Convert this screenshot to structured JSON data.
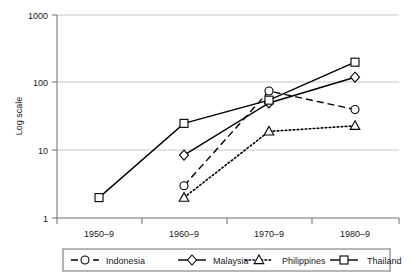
{
  "chart_data": {
    "type": "line",
    "title": "",
    "xlabel": "",
    "ylabel": "Log scale",
    "scale": "log",
    "ylim": [
      1,
      1000
    ],
    "ytick_labels": [
      "1000",
      "100",
      "10",
      "1"
    ],
    "ytick_values": [
      1000,
      100,
      10,
      1
    ],
    "grid": true,
    "legend_position": "bottom",
    "categories": [
      "1950–9",
      "1960–9",
      "1970–9",
      "1980–9"
    ],
    "series": [
      {
        "name": "Indonesia",
        "marker": "circle",
        "line_style": "dashed",
        "values": [
          null,
          3,
          75,
          40
        ]
      },
      {
        "name": "Malaysia",
        "marker": "diamond",
        "line_style": "solid",
        "values": [
          null,
          8.5,
          50,
          120
        ]
      },
      {
        "name": "Philippines",
        "marker": "triangle",
        "line_style": "dotted",
        "values": [
          null,
          2,
          19,
          23
        ]
      },
      {
        "name": "Thailand",
        "marker": "square",
        "line_style": "solid",
        "values": [
          2,
          25,
          55,
          200
        ]
      }
    ],
    "colors": {
      "line": "#000000",
      "grid": "#c8c8c8",
      "axis": "#6e6e6e",
      "text": "#1a1a1a",
      "marker_fill": "#ffffff"
    }
  },
  "axis": {
    "y_title": "Log scale",
    "y_ticks": [
      "1000",
      "100",
      "10",
      "1"
    ],
    "x_ticks": [
      "1950–9",
      "1960–9",
      "1970–9",
      "1980–9"
    ]
  },
  "legend": {
    "items": [
      {
        "label": "Indonesia",
        "marker": "circle",
        "style": "dashed"
      },
      {
        "label": "Malaysia",
        "marker": "diamond",
        "style": "solid"
      },
      {
        "label": "Philippines",
        "marker": "triangle",
        "style": "dotted"
      },
      {
        "label": "Thailand",
        "marker": "square",
        "style": "solid"
      }
    ]
  }
}
